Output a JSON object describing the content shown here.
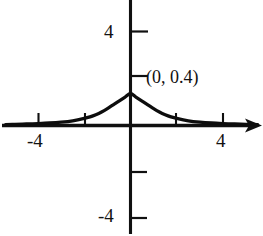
{
  "figure": {
    "name": "bell-curve-graph",
    "background_color": "#ffffff",
    "ink_color": "#101010"
  },
  "annotations": {
    "peak_label": "(0, 0.4)"
  },
  "axes": {
    "x": {
      "label_left": "-4",
      "label_right": "4",
      "tick_values": [
        -4,
        -2,
        2,
        4
      ],
      "range": [
        -5.4,
        5.5
      ],
      "has_arrow_right": true
    },
    "y": {
      "label_top": "4",
      "label_bottom": "-4",
      "tick_values": [
        4,
        2,
        -2,
        -4
      ],
      "range": [
        -5.2,
        5.3
      ],
      "has_arrow_top": false
    }
  },
  "chart_data": {
    "type": "line",
    "title": "",
    "xlabel": "",
    "ylabel": "",
    "xlim": [
      -5.4,
      5.5
    ],
    "ylim": [
      -5.2,
      5.3
    ],
    "grid": false,
    "legend": null,
    "annotations": [
      {
        "text": "(0, 0.4)",
        "x": 0,
        "y": 0.4
      }
    ],
    "xticks": [
      -4,
      -2,
      2,
      4
    ],
    "xticklabels": [
      "-4",
      "",
      "",
      "4"
    ],
    "yticks": [
      -4,
      -2,
      2,
      4
    ],
    "yticklabels": [
      "-4",
      "",
      "",
      "4"
    ],
    "series": [
      {
        "name": "bell-curve",
        "description": "Cauchy-like bell curve peaking at (0, 0.4)",
        "x": [
          -5.4,
          -5.0,
          -4.5,
          -4.0,
          -3.5,
          -3.0,
          -2.5,
          -2.0,
          -1.75,
          -1.5,
          -1.25,
          -1.0,
          -0.75,
          -0.5,
          -0.25,
          0.0,
          0.25,
          0.5,
          0.75,
          1.0,
          1.25,
          1.5,
          1.75,
          2.0,
          2.5,
          3.0,
          3.5,
          4.0,
          4.5,
          5.0,
          5.5
        ],
        "y": [
          0.012,
          0.015,
          0.019,
          0.024,
          0.031,
          0.042,
          0.059,
          0.088,
          0.108,
          0.135,
          0.169,
          0.211,
          0.258,
          0.305,
          0.352,
          0.4,
          0.352,
          0.305,
          0.258,
          0.211,
          0.169,
          0.135,
          0.108,
          0.088,
          0.059,
          0.042,
          0.031,
          0.024,
          0.019,
          0.015,
          0.012
        ]
      }
    ]
  }
}
